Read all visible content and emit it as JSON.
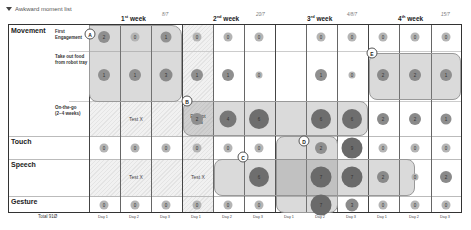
{
  "header": {
    "title": "Awkward moment list",
    "weeks": [
      {
        "label": "1",
        "suffix": "st",
        "word": "week",
        "date": "8/7"
      },
      {
        "label": "2",
        "suffix": "nd",
        "word": "week",
        "date": "20/7"
      },
      {
        "label": "3",
        "suffix": "rd",
        "word": "week",
        "date": "4/8/7"
      },
      {
        "label": "4",
        "suffix": "th",
        "word": "week",
        "date": "15/7"
      }
    ]
  },
  "rows": {
    "movement": "Movement",
    "first_engagement": "First Engagement",
    "take_out_food": "Take out food from robot tray",
    "on_the_go": "On-the-go (2~4 weeks)",
    "touch": "Touch",
    "speech": "Speech",
    "gesture": "Gesture"
  },
  "cells": {
    "first_engagement": [
      "2",
      "0",
      "1",
      "0",
      "0",
      "0",
      "",
      "0",
      "0",
      "0",
      "0",
      "0"
    ],
    "take_out_food": [
      "1",
      "1",
      "3",
      "1",
      "1",
      "0",
      "",
      "1",
      "0",
      "2",
      "2",
      "1"
    ],
    "on_the_go": [
      "",
      "",
      "",
      "2",
      "4",
      "6",
      "",
      "6",
      "6",
      "2",
      "2",
      "1"
    ],
    "touch": [
      "0",
      "0",
      "0",
      "0",
      "0",
      "0",
      "",
      "2",
      "9",
      "0",
      "0",
      "0"
    ],
    "speech": [
      "",
      "",
      "",
      "",
      "",
      "6",
      "",
      "7",
      "7",
      "2",
      "0",
      "2"
    ],
    "gesture": [
      "0",
      "0",
      "0",
      "0",
      "0",
      "0",
      "",
      "7",
      "3",
      "0",
      "0",
      "0"
    ]
  },
  "fill_text": {
    "on_the_go_test": "Test X",
    "except_data": "Except data",
    "speech_test_1": "Test X",
    "speech_test_2": "Test X"
  },
  "tags": [
    "A",
    "B",
    "C",
    "D",
    "E"
  ],
  "footer": {
    "total": "Total 91Ø",
    "days": [
      "Day 1",
      "Day 2",
      "Day 3",
      "Day 1",
      "Day 2",
      "Day 3",
      "Day 1",
      "Day 2",
      "Day 3",
      "Day 1",
      "Day 2",
      "Day 3"
    ]
  }
}
